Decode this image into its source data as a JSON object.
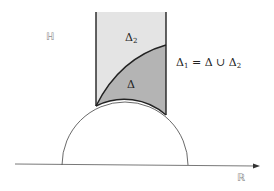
{
  "diagram": {
    "type": "fundamental-domain",
    "labels": {
      "upper_half_plane": "ℍ",
      "real_line": "ℝ",
      "delta2_base": "Δ",
      "delta2_sub": "2",
      "delta": "Δ",
      "union_lhs_base": "Δ",
      "union_lhs_sub": "1",
      "union_rhs": "= Δ ∪ Δ",
      "union_rhs_sub": "2"
    },
    "colors": {
      "line": "#222222",
      "region_delta2": "#e4e4e4",
      "region_delta": "#b4b4b4",
      "axis": "#555555"
    },
    "geometry": {
      "strip_left_x": 96,
      "strip_right_x": 166,
      "strip_top_y": 12,
      "axis_y": 165,
      "semicircle_center_x": 125,
      "semicircle_radius": 63
    }
  }
}
